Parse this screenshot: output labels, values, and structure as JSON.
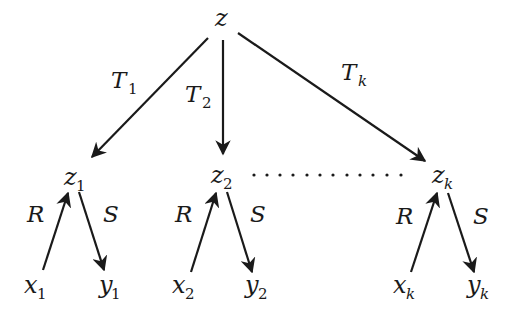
{
  "diagram": {
    "root": {
      "label": "z"
    },
    "branches": [
      {
        "edge_label": {
          "base": "T",
          "sub": "1"
        },
        "node": {
          "base": "z",
          "sub": "1"
        },
        "in_edge": "R",
        "out_edge": "S",
        "input": {
          "base": "x",
          "sub": "1"
        },
        "output": {
          "base": "y",
          "sub": "1"
        }
      },
      {
        "edge_label": {
          "base": "T",
          "sub": "2"
        },
        "node": {
          "base": "z",
          "sub": "2"
        },
        "in_edge": "R",
        "out_edge": "S",
        "input": {
          "base": "x",
          "sub": "2"
        },
        "output": {
          "base": "y",
          "sub": "2"
        }
      },
      {
        "edge_label": {
          "base": "T",
          "sub": "k"
        },
        "node": {
          "base": "z",
          "sub": "k"
        },
        "in_edge": "R",
        "out_edge": "S",
        "input": {
          "base": "x",
          "sub": "k"
        },
        "output": {
          "base": "y",
          "sub": "k"
        }
      }
    ],
    "ellipsis": "dotted line between z2 and zk",
    "colors": {
      "ink": "#1a1a1a",
      "background": "#ffffff"
    }
  }
}
